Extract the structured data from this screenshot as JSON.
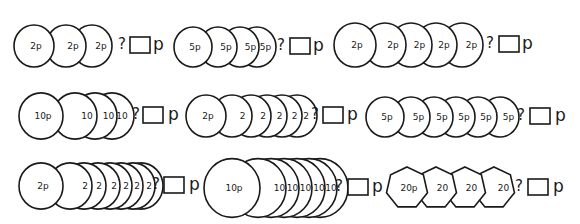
{
  "worksheet": {
    "question_mark": "?",
    "unit": "p",
    "rows": [
      {
        "problems": [
          {
            "coins": [
              {
                "label": "2p",
                "cx": 34,
                "r": 20
              },
              {
                "label": "2p",
                "cx": 66,
                "r": 20
              },
              {
                "label": "2p",
                "cx": 92,
                "r": 20
              }
            ],
            "cy": 46,
            "shape": "circle",
            "q_x": 118,
            "box_x": 130,
            "p_x": 153
          },
          {
            "coins": [
              {
                "label": "5p",
                "cx": 193,
                "r": 19
              },
              {
                "label": "5p",
                "cx": 218,
                "r": 19
              },
              {
                "label": "5p",
                "cx": 240,
                "r": 19
              },
              {
                "label": "5p",
                "cx": 257,
                "r": 19
              }
            ],
            "cy": 47,
            "shape": "circle",
            "q_x": 277,
            "box_x": 290,
            "p_x": 313
          },
          {
            "coins": [
              {
                "label": "2p",
                "cx": 355,
                "r": 21
              },
              {
                "label": "2p",
                "cx": 385,
                "r": 21
              },
              {
                "label": "2p",
                "cx": 411,
                "r": 21
              },
              {
                "label": "2p",
                "cx": 436,
                "r": 21
              },
              {
                "label": "2p",
                "cx": 462,
                "r": 21
              }
            ],
            "cy": 45,
            "shape": "circle",
            "q_x": 486,
            "box_x": 499,
            "p_x": 522
          }
        ]
      },
      {
        "problems": [
          {
            "coins": [
              {
                "label": "10p",
                "cx": 41,
                "r": 22
              },
              {
                "label": "10",
                "cx": 75,
                "r": 22
              },
              {
                "label": "10",
                "cx": 95,
                "r": 22
              },
              {
                "label": "10",
                "cx": 112,
                "r": 22
              }
            ],
            "cy": 116,
            "shape": "circle",
            "q_x": 132,
            "box_x": 143,
            "p_x": 168
          },
          {
            "coins": [
              {
                "label": "2p",
                "cx": 206,
                "r": 20
              },
              {
                "label": "2",
                "cx": 232,
                "r": 20
              },
              {
                "label": "2",
                "cx": 251,
                "r": 20
              },
              {
                "label": "2",
                "cx": 267,
                "r": 20
              },
              {
                "label": "2",
                "cx": 282,
                "r": 20
              },
              {
                "label": "2",
                "cx": 297,
                "r": 20
              }
            ],
            "cy": 116,
            "shape": "circle",
            "q_x": 311,
            "box_x": 323,
            "p_x": 347
          },
          {
            "coins": [
              {
                "label": "5p",
                "cx": 385,
                "r": 19
              },
              {
                "label": "5p",
                "cx": 411,
                "r": 19
              },
              {
                "label": "5p",
                "cx": 434,
                "r": 19
              },
              {
                "label": "5p",
                "cx": 456,
                "r": 19
              },
              {
                "label": "5p",
                "cx": 478,
                "r": 19
              },
              {
                "label": "5p",
                "cx": 500,
                "r": 19
              }
            ],
            "cy": 117,
            "shape": "circle",
            "q_x": 517,
            "box_x": 530,
            "p_x": 555
          }
        ]
      },
      {
        "problems": [
          {
            "coins": [
              {
                "label": "2p",
                "cx": 41,
                "r": 22
              },
              {
                "label": "2",
                "cx": 70,
                "r": 22
              },
              {
                "label": "2",
                "cx": 84,
                "r": 22
              },
              {
                "label": "2",
                "cx": 98,
                "r": 22
              },
              {
                "label": "2",
                "cx": 110,
                "r": 22
              },
              {
                "label": "2",
                "cx": 121,
                "r": 22
              },
              {
                "label": "2",
                "cx": 133,
                "r": 22
              },
              {
                "label": "2",
                "cx": 141,
                "r": 22
              }
            ],
            "cy": 186,
            "shape": "circle",
            "q_x": 152,
            "box_x": 164,
            "p_x": 189
          },
          {
            "coins": [
              {
                "label": "10p",
                "cx": 232,
                "r": 28
              },
              {
                "label": "10",
                "cx": 258,
                "r": 28
              },
              {
                "label": "10",
                "cx": 271,
                "r": 28
              },
              {
                "label": "10",
                "cx": 284,
                "r": 28
              },
              {
                "label": "10",
                "cx": 297,
                "r": 28
              },
              {
                "label": "10",
                "cx": 309,
                "r": 28
              },
              {
                "label": "10",
                "cx": 320,
                "r": 28
              }
            ],
            "cy": 188,
            "shape": "circle",
            "q_x": 335,
            "box_x": 348,
            "p_x": 372
          },
          {
            "coins": [
              {
                "label": "20p",
                "cx": 407,
                "r": 21
              },
              {
                "label": "20",
                "cx": 436,
                "r": 21
              },
              {
                "label": "20",
                "cx": 465,
                "r": 21
              },
              {
                "label": "20",
                "cx": 494,
                "r": 21
              }
            ],
            "cy": 188,
            "shape": "heptagon",
            "q_x": 515,
            "box_x": 528,
            "p_x": 553
          }
        ]
      }
    ]
  }
}
